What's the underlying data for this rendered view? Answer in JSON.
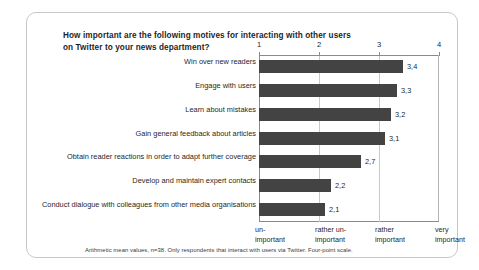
{
  "figure": {
    "title": "How important are the following motives for interacting with other users on Twitter to your news department?",
    "footnote": "Arithmetic mean values, n=38. Only respondents that interact with users via Twitter. Four-point scale.",
    "bar_color": "#434343",
    "frame_color": "#c8c8c8",
    "axis_color": "#8a8a8a",
    "grid_color": "#c9c9c9"
  },
  "chart_data": {
    "type": "bar",
    "orientation": "horizontal",
    "title": "How important are the following motives for interacting with other users on Twitter to your news department?",
    "xlabel": "",
    "ylabel": "",
    "xlim": [
      1,
      4
    ],
    "xticks": [
      "1",
      "2",
      "3",
      "4"
    ],
    "xtick_values": [
      1,
      2,
      3,
      4
    ],
    "scale_labels": [
      "un-\nimportant",
      "rather un-\nimportant",
      "rather\nimportant",
      "very\nimportant"
    ],
    "grid": true,
    "grid_axis": "x",
    "legend": "none",
    "axis_position": "top",
    "categories": [
      "Win over new readers",
      "Engage with users",
      "Learn about mistakes",
      "Gain general feedback about articles",
      "Obtain reader reactions in order to adapt further coverage",
      "Develop and maintain expert contacts",
      "Conduct dialogue with colleagues from other media organisations"
    ],
    "values": [
      3.4,
      3.3,
      3.2,
      3.1,
      2.7,
      2.2,
      2.1
    ],
    "value_labels": [
      "3,4",
      "3,3",
      "3,2",
      "3,1",
      "2,7",
      "2,2",
      "2,1"
    ],
    "annotations": "Arithmetic mean values, n=38. Only respondents that interact with users via Twitter. Four-point scale."
  },
  "scale": {
    "items": [
      {
        "line1": "un-",
        "line2": "important"
      },
      {
        "line1": "rather un-",
        "line2": "important"
      },
      {
        "line1": "rather",
        "line2": "important"
      },
      {
        "line1": "very",
        "line2": "important"
      }
    ]
  }
}
